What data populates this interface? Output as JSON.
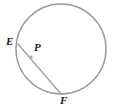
{
  "figure": {
    "background_color": "#ffffff",
    "width": 114,
    "height": 111
  },
  "circle": {
    "name": "circle-P",
    "center_x": 61,
    "center_y": 49,
    "radius": 45,
    "stroke_color": "#9a9a9a",
    "stroke_width": 1.4,
    "fill": "none"
  },
  "segment": {
    "name": "segment-EF",
    "from": "E",
    "to": "F",
    "x1": 18,
    "y1": 44,
    "x2": 61,
    "y2": 94,
    "stroke_color": "#9a9a9a",
    "stroke_width": 1.2
  },
  "points": [
    {
      "id": "E",
      "label": "E",
      "x": 18,
      "y": 44,
      "marker": "none",
      "label_x": 6,
      "label_y": 36
    },
    {
      "id": "P",
      "label": "P",
      "x": 31,
      "y": 57,
      "marker": "square",
      "marker_size": 3,
      "marker_color": "#b0b0b0",
      "label_x": 34,
      "label_y": 42
    },
    {
      "id": "F",
      "label": "F",
      "x": 61,
      "y": 94,
      "marker": "none",
      "label_x": 60,
      "label_y": 95
    }
  ],
  "labels": {
    "E": "E",
    "P": "P",
    "F": "F"
  },
  "colors": {
    "stroke": "#9a9a9a",
    "text": "#1a1a1a",
    "marker": "#b0b0b0",
    "background": "#ffffff"
  }
}
